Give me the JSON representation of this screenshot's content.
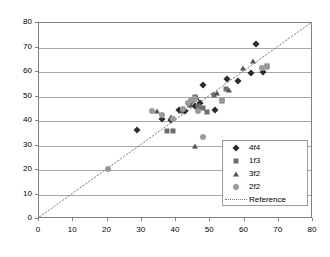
{
  "chart_data": {
    "type": "scatter",
    "title": "",
    "xlabel": "",
    "ylabel": "",
    "xlim": [
      0,
      80
    ],
    "ylim": [
      0,
      80
    ],
    "xticks": [
      0,
      10,
      20,
      30,
      40,
      50,
      60,
      70,
      80
    ],
    "yticks": [
      0,
      10,
      20,
      30,
      40,
      50,
      60,
      70,
      80
    ],
    "grid": "horizontal",
    "legend_position": "lower-right",
    "series": [
      {
        "name": "4f4",
        "marker": "diamond",
        "color": "#2b2b2b",
        "points": [
          [
            28.5,
            36.5
          ],
          [
            36.0,
            41.0
          ],
          [
            38.5,
            40.5
          ],
          [
            41.0,
            44.5
          ],
          [
            42.5,
            44.0
          ],
          [
            45.5,
            46.0
          ],
          [
            46.5,
            45.5
          ],
          [
            47.0,
            47.5
          ],
          [
            48.0,
            54.5
          ],
          [
            51.5,
            44.5
          ],
          [
            55.0,
            57.0
          ],
          [
            58.0,
            56.5
          ],
          [
            62.0,
            59.5
          ],
          [
            63.5,
            71.5
          ],
          [
            65.5,
            60.0
          ]
        ]
      },
      {
        "name": "1f3",
        "marker": "square",
        "color": "#6e6e6e",
        "points": [
          [
            37.5,
            36.0
          ],
          [
            39.0,
            36.0
          ],
          [
            44.0,
            47.0
          ],
          [
            45.0,
            48.5
          ],
          [
            45.5,
            50.0
          ],
          [
            46.5,
            46.0
          ],
          [
            48.0,
            45.5
          ],
          [
            49.0,
            43.5
          ],
          [
            51.0,
            50.5
          ],
          [
            53.5,
            48.0
          ],
          [
            54.5,
            53.0
          ],
          [
            66.5,
            62.5
          ]
        ]
      },
      {
        "name": "3f2",
        "marker": "triangle",
        "color": "#555555",
        "points": [
          [
            34.5,
            44.0
          ],
          [
            38.5,
            41.5
          ],
          [
            41.5,
            44.0
          ],
          [
            44.0,
            46.5
          ],
          [
            44.5,
            48.0
          ],
          [
            45.5,
            30.0
          ],
          [
            46.0,
            49.5
          ],
          [
            52.0,
            51.5
          ],
          [
            55.5,
            52.5
          ],
          [
            59.5,
            61.5
          ],
          [
            62.5,
            64.5
          ]
        ]
      },
      {
        "name": "2f2",
        "marker": "circle",
        "color": "#9a9a9a",
        "points": [
          [
            20.0,
            20.5
          ],
          [
            33.0,
            44.0
          ],
          [
            36.0,
            42.5
          ],
          [
            39.0,
            41.0
          ],
          [
            42.0,
            45.0
          ],
          [
            43.5,
            47.5
          ],
          [
            44.5,
            48.5
          ],
          [
            45.5,
            49.0
          ],
          [
            46.5,
            44.0
          ],
          [
            48.0,
            33.5
          ],
          [
            53.5,
            48.5
          ],
          [
            65.0,
            61.5
          ],
          [
            66.5,
            62.0
          ]
        ]
      }
    ],
    "reference_line": {
      "label": "Reference",
      "style": "dotted",
      "color": "#777777",
      "from": [
        0,
        0
      ],
      "to": [
        80,
        80
      ]
    }
  },
  "legend": {
    "entries": [
      {
        "label": "4f4"
      },
      {
        "label": "1f3"
      },
      {
        "label": "3f2"
      },
      {
        "label": "2f2"
      },
      {
        "label": "Reference"
      }
    ]
  }
}
